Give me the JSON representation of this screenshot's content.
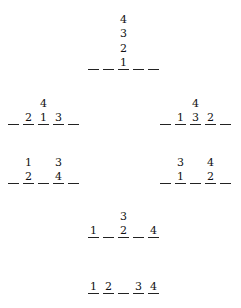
{
  "diagram": {
    "slot_count": 5,
    "groups": [
      {
        "id": "g1",
        "slots": [
          "",
          "",
          "1",
          "",
          ""
        ],
        "stacks": {
          "2": [
            "2",
            "3",
            "4"
          ]
        }
      },
      {
        "id": "g2",
        "slots": [
          "",
          "2",
          "1",
          "3",
          ""
        ],
        "stacks": {
          "2": [
            "4"
          ]
        }
      },
      {
        "id": "g3",
        "slots": [
          "",
          "1",
          "3",
          "2",
          ""
        ],
        "stacks": {
          "2": [
            "4"
          ]
        }
      },
      {
        "id": "g4",
        "slots": [
          "",
          "2",
          "",
          "4",
          ""
        ],
        "stacks": {
          "1": [
            "1"
          ],
          "3": [
            "3"
          ]
        }
      },
      {
        "id": "g5",
        "slots": [
          "",
          "1",
          "",
          "2",
          ""
        ],
        "stacks": {
          "1": [
            "3"
          ],
          "3": [
            "4"
          ]
        }
      },
      {
        "id": "g6",
        "slots": [
          "1",
          "",
          "2",
          "",
          "4"
        ],
        "stacks": {
          "2": [
            "3"
          ]
        }
      },
      {
        "id": "g7",
        "slots": [
          "1",
          "2",
          "",
          "3",
          "4"
        ],
        "stacks": {}
      }
    ]
  },
  "labels": {
    "g1": {
      "s2": "1",
      "a1": "2",
      "a2": "3",
      "a3": "4"
    },
    "g2": {
      "s1": "2",
      "s2": "1",
      "s3": "3",
      "a1": "4"
    },
    "g3": {
      "s1": "1",
      "s2": "3",
      "s3": "2",
      "a1": "4"
    },
    "g4": {
      "s1": "2",
      "s3": "4",
      "a1": "1",
      "a3": "3"
    },
    "g5": {
      "s1": "1",
      "s3": "2",
      "a1": "3",
      "a3": "4"
    },
    "g6": {
      "s0": "1",
      "s2": "2",
      "s4": "4",
      "a2": "3"
    },
    "g7": {
      "s0": "1",
      "s1": "2",
      "s3": "3",
      "s4": "4"
    }
  }
}
